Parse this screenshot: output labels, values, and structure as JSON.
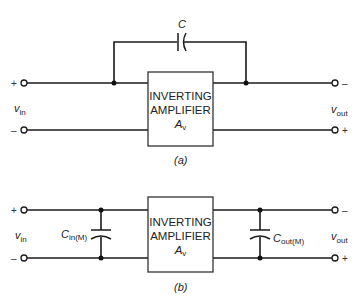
{
  "figure_a": {
    "caption": "(a)",
    "amplifier": {
      "line1": "INVERTING",
      "line2": "AMPLIFIER",
      "gain_symbol": "A",
      "gain_sub": "v"
    },
    "feedback_capacitor": {
      "label": "C"
    },
    "input": {
      "label": "v",
      "label_sub": "in",
      "plus": "+",
      "minus": "–"
    },
    "output": {
      "label": "v",
      "label_sub": "out",
      "top_sign": "–",
      "bottom_sign": "+"
    }
  },
  "figure_b": {
    "caption": "(b)",
    "amplifier": {
      "line1": "INVERTING",
      "line2": "AMPLIFIER",
      "gain_symbol": "A",
      "gain_sub": "v"
    },
    "input_capacitor": {
      "label": "C",
      "label_sub": "in(M)"
    },
    "output_capacitor": {
      "label": "C",
      "label_sub": "out(M)"
    },
    "input": {
      "label": "v",
      "label_sub": "in",
      "plus": "+",
      "minus": "–"
    },
    "output": {
      "label": "v",
      "label_sub": "out",
      "top_sign": "–",
      "bottom_sign": "+"
    }
  }
}
